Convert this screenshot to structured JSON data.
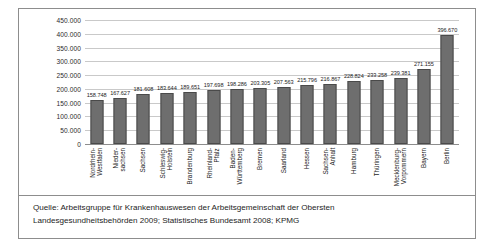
{
  "figure": {
    "caption_line1": "Quelle: Arbeitsgruppe für Krankenhauswesen der Arbeitsgemeinschaft der Obersten",
    "caption_line2": "Landesgesundheitsbehörden 2009; Statistisches Bundesamt 2008; KPMG"
  },
  "colors": {
    "bar_fill": "#6e6e6e",
    "bar_stroke": "#4a4a4a",
    "gridline": "#c9c9c9",
    "axis": "#8d8d8d",
    "text": "#1d1d1d",
    "frame": "#8d8d8d",
    "background": "#ffffff"
  },
  "chart_data": {
    "type": "bar",
    "title": "",
    "xlabel": "",
    "ylabel": "",
    "ylim": [
      0,
      450000
    ],
    "grid": true,
    "legend": false,
    "orientation": "vertical",
    "value_labels": true,
    "ytick_values": [
      450000,
      400000,
      350000,
      300000,
      250000,
      200000,
      150000,
      100000,
      50000,
      0
    ],
    "ytick_labels": [
      "450.000",
      "400.000",
      "350.000",
      "300.000",
      "250.000",
      "200.000",
      "150.000",
      "100.000",
      "50.000",
      "0"
    ],
    "categories": [
      "Nordrhein-Westfalen",
      "Niedersachsen",
      "Sachsen",
      "Schleswig-Holstein",
      "Brandenburg",
      "Rheinland-Pfalz",
      "Baden-Württemberg",
      "Bremen",
      "Saarland",
      "Hessen",
      "Sachsen-Anhalt",
      "Hamburg",
      "Thüringen",
      "Mecklenburg-Vorpommern",
      "Bayern",
      "Berlin"
    ],
    "category_lines": [
      [
        "Nordrhein-",
        "Westfalen"
      ],
      [
        "Nieder-",
        "sachsen"
      ],
      [
        "Sachsen"
      ],
      [
        "Schleswig-",
        "Holstein"
      ],
      [
        "Brandenburg"
      ],
      [
        "Rheinland-",
        "Pfalz"
      ],
      [
        "Baden-",
        "Württemberg"
      ],
      [
        "Bremen"
      ],
      [
        "Saarland"
      ],
      [
        "Hessen"
      ],
      [
        "Sachsen-",
        "Anhalt"
      ],
      [
        "Hamburg"
      ],
      [
        "Thüringen"
      ],
      [
        "Mecklenburg-",
        "Vorpommern"
      ],
      [
        "Bayern"
      ],
      [
        "Berlin"
      ]
    ],
    "values": [
      158748,
      167627,
      181608,
      183644,
      189651,
      197698,
      198286,
      203305,
      207563,
      215796,
      216867,
      228824,
      233258,
      239381,
      271155,
      396670
    ],
    "value_label_texts": [
      "158.748",
      "167.627",
      "181.608",
      "183.644",
      "189.651",
      "197.698",
      "198.286",
      "203.305",
      "207.563",
      "215.796",
      "216.867",
      "228.824",
      "233.258",
      "239.381",
      "271.155",
      "396.670"
    ]
  }
}
